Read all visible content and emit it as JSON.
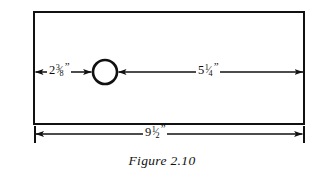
{
  "figure": {
    "caption": "Figure 2.10",
    "stroke_color": "#111111",
    "fill_color": "#ffffff",
    "background_color": "#ffffff"
  },
  "shapes": {
    "plate": {
      "name": "rectangular-plate",
      "x": 33,
      "y": 11,
      "width": 272,
      "height": 114
    },
    "hole": {
      "name": "circular-hole",
      "cx": 105,
      "cy": 72,
      "r": 12
    }
  },
  "dimensions": {
    "left": {
      "id": "left-edge-to-hole",
      "whole": "2",
      "numerator": "3",
      "slash": "⁄",
      "denominator": "8",
      "unit": "”",
      "plain": "2 3/8\"",
      "from_x": 34,
      "to_x": 93,
      "y": 72
    },
    "right": {
      "id": "hole-to-right-edge",
      "whole": "5",
      "numerator": "1",
      "slash": "⁄",
      "denominator": "4",
      "unit": "”",
      "plain": "5 1/4\"",
      "from_x": 117,
      "to_x": 304,
      "y": 72
    },
    "overall": {
      "id": "overall-width",
      "whole": "9",
      "numerator": "1",
      "slash": "⁄",
      "denominator": "2",
      "unit": "”",
      "plain": "9 1/2\"",
      "from_x": 34,
      "to_x": 304,
      "y": 134
    }
  }
}
